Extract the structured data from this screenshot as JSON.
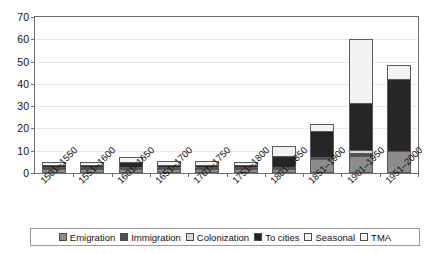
{
  "chart_data": {
    "type": "bar",
    "stacked": true,
    "title": "",
    "subtitle": "",
    "xlabel": "",
    "ylabel": "",
    "ylim": [
      0,
      70
    ],
    "ytick_step": 10,
    "yticks": [
      0,
      10,
      20,
      30,
      40,
      50,
      60,
      70
    ],
    "grid": true,
    "legend_position": "bottom",
    "categories": [
      "1501–1550",
      "1551–1600",
      "1601–1650",
      "1651–1700",
      "1701–1750",
      "1751–1800",
      "1801–1850",
      "1851–1900",
      "1901–1950",
      "1951–2000"
    ],
    "series": [
      {
        "name": "Emigration",
        "color": "#8c8c8c",
        "values": [
          2.0,
          2.0,
          2.0,
          2.0,
          2.0,
          2.0,
          2.0,
          6.5,
          7.5,
          10.0
        ]
      },
      {
        "name": "Immigration",
        "color": "#4f4f4f",
        "values": [
          0.5,
          0.5,
          0.5,
          0.5,
          0.5,
          0.5,
          0.5,
          0.5,
          1.5,
          0.0
        ]
      },
      {
        "name": "Colonization",
        "color": "#d9d9d9",
        "values": [
          0.0,
          0.0,
          0.0,
          0.0,
          0.0,
          0.0,
          0.0,
          0.0,
          1.5,
          0.0
        ]
      },
      {
        "name": "To cities",
        "color": "#262626",
        "values": [
          1.0,
          1.0,
          2.5,
          1.0,
          1.0,
          1.0,
          5.0,
          12.0,
          21.0,
          32.0
        ]
      },
      {
        "name": "Seasonal",
        "color": "#f2f2f2",
        "values": [
          1.5,
          1.5,
          2.0,
          2.0,
          2.0,
          1.5,
          4.5,
          3.0,
          28.5,
          6.5
        ]
      },
      {
        "name": "TMA",
        "color": "#fbfbfb",
        "values": [
          0.0,
          0.0,
          0.0,
          0.0,
          0.0,
          0.0,
          0.0,
          0.0,
          0.0,
          0.0
        ]
      }
    ],
    "totals": [
      5.0,
      5.0,
      7.0,
      5.5,
      5.5,
      5.0,
      12.0,
      22.0,
      60.0,
      48.5
    ]
  },
  "axes": {
    "y_tick_labels": [
      "0",
      "10",
      "20",
      "30",
      "40",
      "50",
      "60",
      "70"
    ]
  },
  "legend": {
    "items": [
      {
        "label": "Emigration",
        "swatch": "legend-swatch-emigration"
      },
      {
        "label": "Immigration",
        "swatch": "legend-swatch-immigration"
      },
      {
        "label": "Colonization",
        "swatch": "legend-swatch-colonization"
      },
      {
        "label": "To cities",
        "swatch": "legend-swatch-to-cities"
      },
      {
        "label": "Seasonal",
        "swatch": "legend-swatch-seasonal"
      },
      {
        "label": "TMA",
        "swatch": "legend-swatch-tma"
      }
    ]
  }
}
